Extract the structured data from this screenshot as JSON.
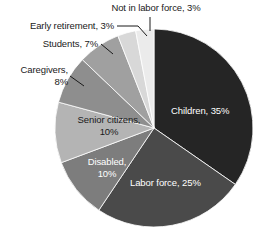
{
  "chart_data": {
    "type": "pie",
    "title": "",
    "subtitle": "",
    "xlabel": "",
    "ylabel": "",
    "legend_position": "none",
    "grid": false,
    "units": "percent",
    "total": 101,
    "categories": [
      "Children",
      "Labor force",
      "Disabled",
      "Senior citizens",
      "Caregivers",
      "Students",
      "Early retirement",
      "Not in labor force"
    ],
    "values": [
      35,
      25,
      10,
      10,
      8,
      7,
      3,
      3
    ],
    "slices": [
      {
        "label": "Children",
        "value": 35,
        "label_text": "Children, 35%",
        "color": "#252525",
        "label_placement": "inside",
        "label_color": "#ffffff"
      },
      {
        "label": "Labor force",
        "value": 25,
        "label_text": "Labor force, 25%",
        "color": "#4a4a4a",
        "label_placement": "inside",
        "label_color": "#ffffff"
      },
      {
        "label": "Disabled",
        "value": 10,
        "label_text": "Disabled,\n10%",
        "color": "#7d7d7d",
        "label_placement": "inside",
        "label_color": "#ffffff"
      },
      {
        "label": "Senior citizens",
        "value": 10,
        "label_text": "Senior citizens,\n10%",
        "color": "#b4b4b4",
        "label_placement": "inside",
        "label_color": "#1a1a1a"
      },
      {
        "label": "Caregivers",
        "value": 8,
        "label_text": "Caregivers,\n8%",
        "color": "#8e8e8e",
        "label_placement": "outside",
        "label_color": "#1a1a1a"
      },
      {
        "label": "Students",
        "value": 7,
        "label_text": "Students, 7%",
        "color": "#a0a0a0",
        "label_placement": "outside",
        "label_color": "#1a1a1a"
      },
      {
        "label": "Early retirement",
        "value": 3,
        "label_text": "Early retirement, 3%",
        "color": "#d8d8d8",
        "label_placement": "outside",
        "label_color": "#1a1a1a"
      },
      {
        "label": "Not in labor force",
        "value": 3,
        "label_text": "Not in labor force, 3%",
        "color": "#ebebeb",
        "label_placement": "outside",
        "label_color": "#1a1a1a"
      }
    ]
  }
}
